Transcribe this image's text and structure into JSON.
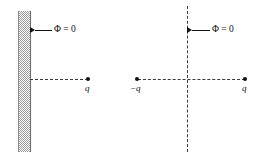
{
  "figure": {
    "caption": "",
    "background_color": "#ffffff",
    "ink_color": "#111111",
    "dash_color": "#3a3a3a",
    "conductor_color": "#9a9a9a"
  },
  "panels": [
    {
      "id": "left",
      "name": "grounded-conductor-panel",
      "conductor": {
        "label": "",
        "fill": "hatched-gray"
      },
      "potential_annotation": {
        "text": "Φ = 0",
        "symbol": "Φ",
        "value": "0",
        "arrow_direction": "left"
      },
      "charges": [
        {
          "label": "q",
          "sign": "positive",
          "x": 88,
          "y": 79
        }
      ]
    },
    {
      "id": "right",
      "name": "image-charge-panel",
      "potential_annotation": {
        "text": "Φ = 0",
        "symbol": "Φ",
        "value": "0",
        "arrow_direction": "left"
      },
      "charges": [
        {
          "label": "−q",
          "sign": "negative",
          "x": 137,
          "y": 79
        },
        {
          "label": "q",
          "sign": "positive",
          "x": 245,
          "y": 79
        }
      ],
      "symmetry_plane": {
        "orientation": "vertical",
        "style": "dashed"
      }
    }
  ]
}
